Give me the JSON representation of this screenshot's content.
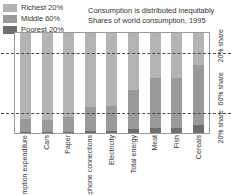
{
  "legend": {
    "items": [
      {
        "label": "Richest 20%",
        "color": "#b4b4b4"
      },
      {
        "label": "Middle 60%",
        "color": "#9a9a9a"
      },
      {
        "label": "Poorest 20%",
        "color": "#6e6e6e"
      }
    ]
  },
  "title": {
    "line1": "Consumption is distributed inequitably",
    "line2": "Shares of world consumption, 1995"
  },
  "share_labels": [
    {
      "text": "20% share",
      "top_pct": 0,
      "height_pct": 26
    },
    {
      "text": "60% share",
      "top_pct": 26,
      "height_pct": 60
    },
    {
      "text": "20% share",
      "top_pct": 86,
      "height_pct": 14
    }
  ],
  "chart_data": {
    "type": "bar",
    "title": "Consumption is distributed inequitably",
    "subtitle": "Shares of world consumption, 1995",
    "xlabel": "",
    "ylabel": "",
    "ylim": [
      0,
      100
    ],
    "grid": false,
    "stacked": true,
    "legend_position": "top-left",
    "categories": [
      "Total consumption expenditure",
      "Cars",
      "Paper",
      "Telephone connections",
      "Electricity",
      "Total energy",
      "Meat",
      "Fish",
      "Cereals"
    ],
    "series": [
      {
        "name": "Richest 20%",
        "color": "#b4b4b4",
        "values": [
          86,
          87,
          84,
          74,
          73,
          58,
          45,
          45,
          32
        ]
      },
      {
        "name": "Middle 60%",
        "color": "#9a9a9a",
        "values": [
          13,
          12,
          15,
          24,
          25,
          39,
          50,
          50,
          60
        ]
      },
      {
        "name": "Poorest 20%",
        "color": "#6e6e6e",
        "values": [
          1.3,
          1,
          1.1,
          1.5,
          2.5,
          4,
          5,
          5,
          8
        ]
      }
    ],
    "reference_lines": [
      {
        "value": 80,
        "style": "dashed"
      },
      {
        "value": 20,
        "style": "dashed"
      }
    ]
  }
}
